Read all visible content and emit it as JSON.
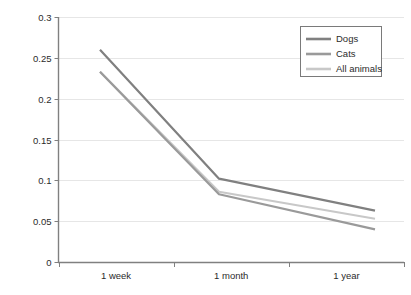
{
  "chart_data": {
    "type": "line",
    "title": "",
    "subtitle": "",
    "xlabel": "",
    "ylabel": "",
    "categories": [
      "1 week",
      "1 month",
      "1 year"
    ],
    "series": [
      {
        "name": "Dogs",
        "values": [
          0.26,
          0.102,
          0.063
        ],
        "color": "#808080"
      },
      {
        "name": "Cats",
        "values": [
          0.233,
          0.083,
          0.04
        ],
        "color": "#9a9a9a"
      },
      {
        "name": "All animals",
        "values": [
          0.233,
          0.086,
          0.053
        ],
        "color": "#c8c8c8"
      }
    ],
    "ylim": [
      0,
      0.3
    ],
    "yticks": [
      0,
      0.05,
      0.1,
      0.15,
      0.2,
      0.25,
      0.3
    ],
    "ytick_labels": [
      "0",
      "0.05",
      "0.1",
      "0.15",
      "0.2",
      "0.25",
      "0.3"
    ],
    "xtick_labels": [
      "1 week",
      "1 month",
      "1 year"
    ],
    "grid": true,
    "grid_axis": "y",
    "legend_position": "top-right",
    "legend_entries": [
      "Dogs",
      "Cats",
      "All animals"
    ],
    "colors": {
      "axis": "#808080",
      "grid": "#e6e6e6",
      "text": "#2b2b2b",
      "legend_border": "#7a7a7a",
      "background": "#ffffff"
    }
  }
}
